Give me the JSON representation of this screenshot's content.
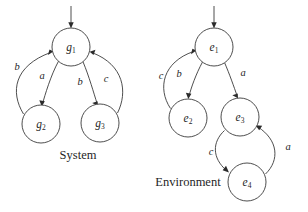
{
  "figure": {
    "background": "#ffffff",
    "stroke_color": "#3a3a3a",
    "text_color": "#1f1f1f",
    "width": 308,
    "height": 212
  },
  "captions": {
    "system": "System",
    "environment": "Environment"
  },
  "graphs": [
    {
      "name": "system",
      "caption": "System",
      "initial_state": "g1",
      "nodes": [
        {
          "id": "g1",
          "base": "g",
          "sub": "1",
          "cx": 71,
          "cy": 47,
          "r": 19
        },
        {
          "id": "g2",
          "base": "g",
          "sub": "2",
          "cx": 41,
          "cy": 124,
          "r": 19
        },
        {
          "id": "g3",
          "base": "g",
          "sub": "3",
          "cx": 100,
          "cy": 123,
          "r": 19
        }
      ],
      "edges": [
        {
          "from": "g1",
          "to": "g2",
          "label": "a",
          "label_x": 42,
          "label_y": 77
        },
        {
          "from": "g2",
          "to": "g1",
          "label": "b",
          "label_x": 17,
          "label_y": 68
        },
        {
          "from": "g1",
          "to": "g3",
          "label": "b",
          "label_x": 80,
          "label_y": 83
        },
        {
          "from": "g3",
          "to": "g1",
          "label": "c",
          "label_x": 106,
          "label_y": 80
        }
      ]
    },
    {
      "name": "environment",
      "caption": "Environment",
      "initial_state": "e1",
      "nodes": [
        {
          "id": "e1",
          "base": "e",
          "sub": "1",
          "cx": 214,
          "cy": 47,
          "r": 19
        },
        {
          "id": "e2",
          "base": "e",
          "sub": "2",
          "cx": 188,
          "cy": 118,
          "r": 19
        },
        {
          "id": "e3",
          "base": "e",
          "sub": "3",
          "cx": 240,
          "cy": 117,
          "r": 19
        },
        {
          "id": "e4",
          "base": "e",
          "sub": "4",
          "cx": 247,
          "cy": 182,
          "r": 19
        }
      ],
      "edges": [
        {
          "from": "e1",
          "to": "e2",
          "label": "b",
          "label_x": 179,
          "label_y": 75
        },
        {
          "from": "e2",
          "to": "e1",
          "label": "c",
          "label_x": 161,
          "label_y": 77
        },
        {
          "from": "e1",
          "to": "e3",
          "label": "a",
          "label_x": 243,
          "label_y": 74
        },
        {
          "from": "e3",
          "to": "e4",
          "label": "c",
          "label_x": 211,
          "label_y": 153
        },
        {
          "from": "e4",
          "to": "e3",
          "label": "a",
          "label_x": 288,
          "label_y": 148
        }
      ]
    }
  ],
  "initial_arrows": [
    {
      "target": "g1",
      "x": 71,
      "y_start": 6,
      "y_end": 27
    },
    {
      "target": "e1",
      "x": 214,
      "y_start": 6,
      "y_end": 27
    }
  ]
}
